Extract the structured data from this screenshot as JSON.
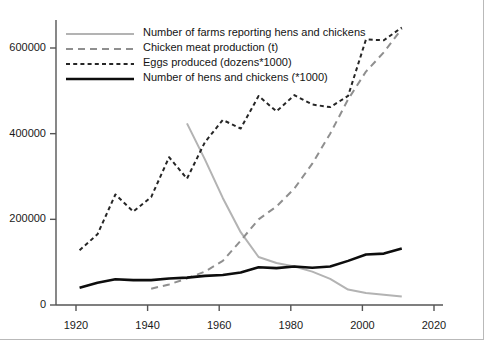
{
  "chart_data": {
    "type": "line",
    "title": "",
    "xlabel": "",
    "ylabel": "",
    "xlim": [
      1915,
      2022
    ],
    "ylim": [
      0,
      680000
    ],
    "xticks": [
      "1920",
      "1940",
      "1960",
      "1980",
      "2000",
      "2020"
    ],
    "yticks": [
      "0",
      "200000",
      "400000",
      "600000"
    ],
    "grid": false,
    "legend_position": "top-left",
    "series": [
      {
        "name": "Number of farms reporting hens and chickens",
        "style": "solid",
        "color": "#b3b3b3",
        "width": 2.0,
        "x": [
          1951,
          1956,
          1961,
          1966,
          1971,
          1976,
          1981,
          1986,
          1991,
          1996,
          2001,
          2006,
          2011
        ],
        "values": [
          424000,
          340000,
          250000,
          170000,
          112000,
          98000,
          90000,
          78000,
          61000,
          36000,
          28000,
          24000,
          20000
        ]
      },
      {
        "name": "Chicken meat production (t)",
        "style": "longdash",
        "color": "#8f8f8f",
        "width": 2.0,
        "x": [
          1941,
          1946,
          1951,
          1956,
          1961,
          1966,
          1971,
          1976,
          1981,
          1986,
          1991,
          1996,
          2001,
          2006,
          2011
        ],
        "values": [
          38000,
          48000,
          62000,
          78000,
          103000,
          150000,
          200000,
          230000,
          272000,
          330000,
          400000,
          480000,
          545000,
          590000,
          645000
        ]
      },
      {
        "name": "Eggs produced (dozens*1000)",
        "style": "shortdash",
        "color": "#262626",
        "width": 2.0,
        "x": [
          1921,
          1926,
          1931,
          1936,
          1941,
          1946,
          1951,
          1956,
          1961,
          1966,
          1971,
          1976,
          1981,
          1986,
          1991,
          1996,
          2001,
          2006,
          2011
        ],
        "values": [
          128000,
          165000,
          258000,
          218000,
          252000,
          345000,
          295000,
          380000,
          432000,
          412000,
          488000,
          452000,
          490000,
          468000,
          462000,
          488000,
          620000,
          618000,
          648000
        ]
      },
      {
        "name": "Number of hens and chickens (*1000)",
        "style": "solid",
        "color": "#0d0d0d",
        "width": 2.6,
        "x": [
          1921,
          1926,
          1931,
          1936,
          1941,
          1946,
          1951,
          1956,
          1961,
          1966,
          1971,
          1976,
          1981,
          1986,
          1991,
          1996,
          2001,
          2006,
          2011
        ],
        "values": [
          40000,
          52000,
          60000,
          58000,
          58000,
          62000,
          64000,
          68000,
          70000,
          76000,
          88000,
          86000,
          90000,
          87000,
          90000,
          103000,
          118000,
          120000,
          132000
        ]
      }
    ],
    "legend": [
      {
        "label": "Number of farms reporting hens and chickens",
        "style": "solid",
        "color": "#b3b3b3",
        "width": 2.0
      },
      {
        "label": "Chicken meat production (t)",
        "style": "longdash",
        "color": "#8f8f8f",
        "width": 2.0
      },
      {
        "label": "Eggs produced (dozens*1000)",
        "style": "shortdash",
        "color": "#262626",
        "width": 2.0
      },
      {
        "label": "Number of hens and chickens (*1000)",
        "style": "solid",
        "color": "#0d0d0d",
        "width": 2.6
      }
    ],
    "axis_color": "#555555"
  }
}
